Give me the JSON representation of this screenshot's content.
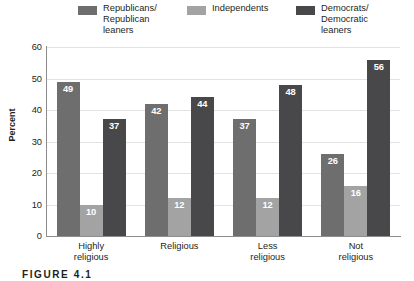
{
  "chart_data": {
    "type": "bar",
    "title": "",
    "xlabel": "",
    "ylabel": "Percent",
    "ylim": [
      0,
      60
    ],
    "yticks": [
      0,
      10,
      20,
      30,
      40,
      50,
      60
    ],
    "grid": true,
    "legend_position": "top",
    "categories": [
      "Highly\nreligious",
      "Religious",
      "Less\nreligious",
      "Not\nreligious"
    ],
    "series": [
      {
        "name": "Republicans/\nRepublican\nleaners",
        "color": "#6e6e6e",
        "values": [
          49,
          42,
          37,
          26
        ]
      },
      {
        "name": "Independents",
        "color": "#a3a3a3",
        "values": [
          10,
          12,
          12,
          16
        ]
      },
      {
        "name": "Democrats/\nDemocratic\nleaners",
        "color": "#48484a",
        "values": [
          37,
          44,
          48,
          56
        ]
      }
    ]
  },
  "caption": {
    "text": "FIGURE 4.1"
  },
  "colors": {
    "axis": "#8d8d8d",
    "grid": "#e3e3e3",
    "text": "#231f20",
    "value_label": "#ffffff"
  }
}
